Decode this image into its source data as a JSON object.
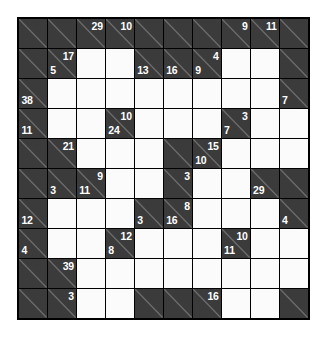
{
  "puzzle": {
    "type": "kakuro",
    "rows": 10,
    "columns": 10,
    "colors": {
      "block": "#3b3b3b",
      "cell": "#fbfbfb",
      "grid_line": "#000000",
      "clue_text": "#ffffff",
      "page_background": "#ffffff"
    },
    "cells": [
      [
        {
          "kind": "block"
        },
        {
          "kind": "block"
        },
        {
          "kind": "block",
          "down": "29"
        },
        {
          "kind": "block",
          "down": "10"
        },
        {
          "kind": "block"
        },
        {
          "kind": "block"
        },
        {
          "kind": "block"
        },
        {
          "kind": "block",
          "down": "9"
        },
        {
          "kind": "block",
          "down": "11"
        },
        {
          "kind": "block"
        }
      ],
      [
        {
          "kind": "block"
        },
        {
          "kind": "block",
          "down": "17",
          "across": "5"
        },
        {
          "kind": "entry"
        },
        {
          "kind": "entry"
        },
        {
          "kind": "block",
          "across": "13"
        },
        {
          "kind": "block",
          "across": "16"
        },
        {
          "kind": "block",
          "down": "4",
          "across": "9"
        },
        {
          "kind": "entry"
        },
        {
          "kind": "entry"
        },
        {
          "kind": "block"
        }
      ],
      [
        {
          "kind": "block",
          "across": "38"
        },
        {
          "kind": "entry"
        },
        {
          "kind": "entry"
        },
        {
          "kind": "entry"
        },
        {
          "kind": "entry"
        },
        {
          "kind": "entry"
        },
        {
          "kind": "entry"
        },
        {
          "kind": "entry"
        },
        {
          "kind": "entry"
        },
        {
          "kind": "block",
          "across": "7"
        }
      ],
      [
        {
          "kind": "block",
          "across": "11"
        },
        {
          "kind": "entry"
        },
        {
          "kind": "entry"
        },
        {
          "kind": "block",
          "down": "10",
          "across": "24"
        },
        {
          "kind": "entry"
        },
        {
          "kind": "entry"
        },
        {
          "kind": "entry"
        },
        {
          "kind": "block",
          "down": "3",
          "across": "7"
        },
        {
          "kind": "entry"
        },
        {
          "kind": "entry"
        }
      ],
      [
        {
          "kind": "block"
        },
        {
          "kind": "block",
          "down": "21"
        },
        {
          "kind": "entry"
        },
        {
          "kind": "entry"
        },
        {
          "kind": "entry"
        },
        {
          "kind": "block"
        },
        {
          "kind": "block",
          "down": "15",
          "across": "10"
        },
        {
          "kind": "entry"
        },
        {
          "kind": "entry"
        },
        {
          "kind": "entry"
        }
      ],
      [
        {
          "kind": "block"
        },
        {
          "kind": "block",
          "across": "3"
        },
        {
          "kind": "block",
          "down": "9",
          "across": "11"
        },
        {
          "kind": "entry"
        },
        {
          "kind": "entry"
        },
        {
          "kind": "block",
          "down": "3"
        },
        {
          "kind": "entry"
        },
        {
          "kind": "entry"
        },
        {
          "kind": "block",
          "across": "29"
        },
        {
          "kind": "block"
        }
      ],
      [
        {
          "kind": "block",
          "across": "12"
        },
        {
          "kind": "entry"
        },
        {
          "kind": "entry"
        },
        {
          "kind": "entry"
        },
        {
          "kind": "block",
          "across": "3"
        },
        {
          "kind": "block",
          "down": "8",
          "across": "16"
        },
        {
          "kind": "entry"
        },
        {
          "kind": "entry"
        },
        {
          "kind": "entry"
        },
        {
          "kind": "block",
          "across": "4"
        }
      ],
      [
        {
          "kind": "block",
          "across": "4"
        },
        {
          "kind": "entry"
        },
        {
          "kind": "entry"
        },
        {
          "kind": "block",
          "down": "12",
          "across": "8"
        },
        {
          "kind": "entry"
        },
        {
          "kind": "entry"
        },
        {
          "kind": "entry"
        },
        {
          "kind": "block",
          "down": "10",
          "across": "11"
        },
        {
          "kind": "entry"
        },
        {
          "kind": "entry"
        }
      ],
      [
        {
          "kind": "block"
        },
        {
          "kind": "block",
          "down": "39"
        },
        {
          "kind": "entry"
        },
        {
          "kind": "entry"
        },
        {
          "kind": "entry"
        },
        {
          "kind": "entry"
        },
        {
          "kind": "entry"
        },
        {
          "kind": "entry"
        },
        {
          "kind": "entry"
        },
        {
          "kind": "entry"
        }
      ],
      [
        {
          "kind": "block"
        },
        {
          "kind": "block",
          "down": "3"
        },
        {
          "kind": "entry"
        },
        {
          "kind": "entry"
        },
        {
          "kind": "block"
        },
        {
          "kind": "block"
        },
        {
          "kind": "block",
          "down": "16"
        },
        {
          "kind": "entry"
        },
        {
          "kind": "entry"
        },
        {
          "kind": "block"
        }
      ]
    ]
  }
}
